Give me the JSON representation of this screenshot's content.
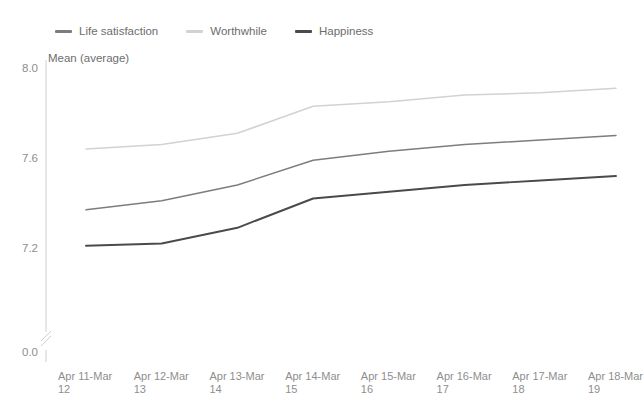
{
  "chart_data": {
    "type": "line",
    "title": "",
    "xlabel": "",
    "ylabel": "Mean (average)",
    "ylim": [
      7.0,
      8.0
    ],
    "yticks": [
      "0.0",
      "7.2",
      "7.6",
      "8.0"
    ],
    "grid": false,
    "axis_break": true,
    "legend_position": "top-left",
    "categories": [
      "Apr 11-Mar 12",
      "Apr 12-Mar 13",
      "Apr 13-Mar 14",
      "Apr 14-Mar 15",
      "Apr 15-Mar 16",
      "Apr 16-Mar 17",
      "Apr 17-Mar 18",
      "Apr 18-Mar 19"
    ],
    "category_lines": [
      {
        "line1": "Apr 11-Mar",
        "line2": "12"
      },
      {
        "line1": "Apr 12-Mar",
        "line2": "13"
      },
      {
        "line1": "Apr 13-Mar",
        "line2": "14"
      },
      {
        "line1": "Apr 14-Mar",
        "line2": "15"
      },
      {
        "line1": "Apr 15-Mar",
        "line2": "16"
      },
      {
        "line1": "Apr 16-Mar",
        "line2": "17"
      },
      {
        "line1": "Apr 17-Mar",
        "line2": "18"
      },
      {
        "line1": "Apr 18-Mar",
        "line2": "19"
      }
    ],
    "series": [
      {
        "name": "Life satisfaction",
        "color": "#7d7d7d",
        "values": [
          7.37,
          7.41,
          7.48,
          7.59,
          7.63,
          7.66,
          7.68,
          7.7
        ]
      },
      {
        "name": "Worthwhile",
        "color": "#d2d2d2",
        "values": [
          7.64,
          7.66,
          7.71,
          7.83,
          7.85,
          7.88,
          7.89,
          7.91
        ]
      },
      {
        "name": "Happiness",
        "color": "#4a4a4a",
        "values": [
          7.21,
          7.22,
          7.29,
          7.42,
          7.45,
          7.48,
          7.5,
          7.52
        ]
      }
    ]
  },
  "legend": {
    "items": [
      {
        "label": "Life satisfaction"
      },
      {
        "label": "Worthwhile"
      },
      {
        "label": "Happiness"
      }
    ]
  },
  "axes": {
    "y_title": "Mean (average)",
    "y_labels": [
      {
        "text": "8.0",
        "value": 8.0
      },
      {
        "text": "7.6",
        "value": 7.6
      },
      {
        "text": "7.2",
        "value": 7.2
      },
      {
        "text": "0.0",
        "value": 0.0
      }
    ]
  },
  "colors": {
    "life_satisfaction": "#7d7d7d",
    "worthwhile": "#d2d2d2",
    "happiness": "#4a4a4a",
    "axis": "#cfcfcf",
    "tick_text": "#8e8e8e",
    "label_text": "#6d6d6d",
    "background": "#ffffff"
  }
}
